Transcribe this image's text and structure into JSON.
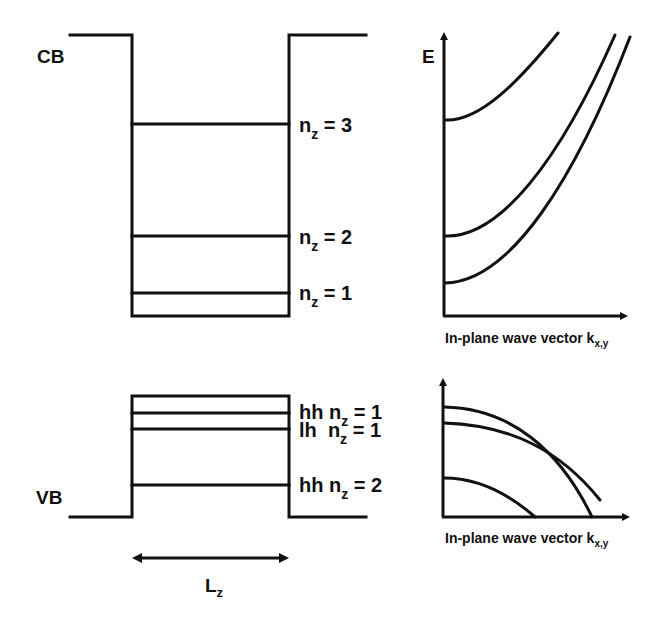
{
  "well": {
    "cb_label": "CB",
    "vb_label": "VB",
    "width_label": "L",
    "width_label_sub": "z",
    "cb_levels": [
      {
        "n": "n",
        "sub": "z",
        "text": " = 3"
      },
      {
        "n": "n",
        "sub": "z",
        "text": " = 2"
      },
      {
        "n": "n",
        "sub": "z",
        "text": " = 1"
      }
    ],
    "vb_levels": [
      {
        "prefix": "hh ",
        "n": "n",
        "sub": "z",
        "text": " = 1"
      },
      {
        "prefix": "lh  ",
        "n": "n",
        "sub": "z",
        "text": " = 1"
      },
      {
        "prefix": "hh ",
        "n": "n",
        "sub": "z",
        "text": " = 2"
      }
    ]
  },
  "cb_plot": {
    "y_label": "E",
    "x_label": "In-plane wave vector k",
    "x_label_sub": "x,y"
  },
  "vb_plot": {
    "x_label": "In-plane wave vector k",
    "x_label_sub": "x,y"
  },
  "colors": {
    "line": "#111111",
    "background": "#ffffff"
  }
}
